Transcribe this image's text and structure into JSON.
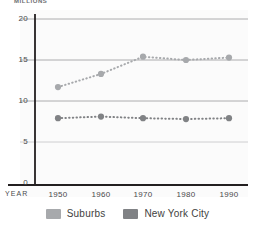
{
  "chart_data": {
    "type": "line",
    "title": "MILLIONS",
    "xlabel": "YEAR",
    "ylabel": "",
    "categories": [
      "1950",
      "1960",
      "1970",
      "1980",
      "1990"
    ],
    "x": [
      1950,
      1960,
      1970,
      1980,
      1990
    ],
    "xlim": [
      1945,
      1995
    ],
    "ylim": [
      0,
      20
    ],
    "yticks": [
      "0",
      "5",
      "10",
      "15",
      "20"
    ],
    "ytick_values": [
      0,
      5,
      10,
      15,
      20
    ],
    "grid": true,
    "legend_position": "bottom",
    "line_style": "dotted",
    "marker": "circle",
    "series": [
      {
        "name": "Suburbs",
        "color": "#a7a9ac",
        "values": [
          11.7,
          13.3,
          15.4,
          15.0,
          15.3
        ]
      },
      {
        "name": "New York City",
        "color": "#808285",
        "values": [
          7.9,
          8.1,
          7.9,
          7.8,
          7.9
        ]
      }
    ]
  },
  "legend": {
    "items": [
      {
        "label": "Suburbs",
        "color": "#a7a9ac"
      },
      {
        "label": "New York City",
        "color": "#808285"
      }
    ]
  },
  "colors": {
    "suburbs": "#a7a9ac",
    "new_york_city": "#808285",
    "gridline": "#9a9a9c",
    "axis": "#231f20",
    "text": "#4a4a4c"
  }
}
